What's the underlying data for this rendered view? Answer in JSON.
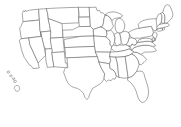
{
  "map": {
    "title": "Blank outline map of the United States",
    "projection": "Albers-like conic (contiguous US) with Hawaii inset",
    "background_color": "#ffffff",
    "border_color": "#5f5f63",
    "fill_color": "#ffffff",
    "border_width_px": 0.55,
    "width_px": 181,
    "height_px": 127,
    "labels_shown": false,
    "includes_alaska": false,
    "includes_hawaii": true,
    "hawaii_inset_position": "lower-left",
    "region_count": 49,
    "regions": [
      {
        "name": "Washington",
        "abbr": "WA",
        "label": ""
      },
      {
        "name": "Oregon",
        "abbr": "OR",
        "label": ""
      },
      {
        "name": "California",
        "abbr": "CA",
        "label": ""
      },
      {
        "name": "Nevada",
        "abbr": "NV",
        "label": ""
      },
      {
        "name": "Idaho",
        "abbr": "ID",
        "label": ""
      },
      {
        "name": "Montana",
        "abbr": "MT",
        "label": ""
      },
      {
        "name": "Wyoming",
        "abbr": "WY",
        "label": ""
      },
      {
        "name": "Utah",
        "abbr": "UT",
        "label": ""
      },
      {
        "name": "Arizona",
        "abbr": "AZ",
        "label": ""
      },
      {
        "name": "Colorado",
        "abbr": "CO",
        "label": ""
      },
      {
        "name": "New Mexico",
        "abbr": "NM",
        "label": ""
      },
      {
        "name": "North Dakota",
        "abbr": "ND",
        "label": ""
      },
      {
        "name": "South Dakota",
        "abbr": "SD",
        "label": ""
      },
      {
        "name": "Nebraska",
        "abbr": "NE",
        "label": ""
      },
      {
        "name": "Kansas",
        "abbr": "KS",
        "label": ""
      },
      {
        "name": "Oklahoma",
        "abbr": "OK",
        "label": ""
      },
      {
        "name": "Texas",
        "abbr": "TX",
        "label": ""
      },
      {
        "name": "Minnesota",
        "abbr": "MN",
        "label": ""
      },
      {
        "name": "Iowa",
        "abbr": "IA",
        "label": ""
      },
      {
        "name": "Missouri",
        "abbr": "MO",
        "label": ""
      },
      {
        "name": "Arkansas",
        "abbr": "AR",
        "label": ""
      },
      {
        "name": "Louisiana",
        "abbr": "LA",
        "label": ""
      },
      {
        "name": "Wisconsin",
        "abbr": "WI",
        "label": ""
      },
      {
        "name": "Illinois",
        "abbr": "IL",
        "label": ""
      },
      {
        "name": "Michigan",
        "abbr": "MI",
        "label": ""
      },
      {
        "name": "Indiana",
        "abbr": "IN",
        "label": ""
      },
      {
        "name": "Ohio",
        "abbr": "OH",
        "label": ""
      },
      {
        "name": "Kentucky",
        "abbr": "KY",
        "label": ""
      },
      {
        "name": "Tennessee",
        "abbr": "TN",
        "label": ""
      },
      {
        "name": "Mississippi",
        "abbr": "MS",
        "label": ""
      },
      {
        "name": "Alabama",
        "abbr": "AL",
        "label": ""
      },
      {
        "name": "Georgia",
        "abbr": "GA",
        "label": ""
      },
      {
        "name": "Florida",
        "abbr": "FL",
        "label": ""
      },
      {
        "name": "South Carolina",
        "abbr": "SC",
        "label": ""
      },
      {
        "name": "North Carolina",
        "abbr": "NC",
        "label": ""
      },
      {
        "name": "Virginia",
        "abbr": "VA",
        "label": ""
      },
      {
        "name": "West Virginia",
        "abbr": "WV",
        "label": ""
      },
      {
        "name": "Maryland",
        "abbr": "MD",
        "label": ""
      },
      {
        "name": "Delaware",
        "abbr": "DE",
        "label": ""
      },
      {
        "name": "Pennsylvania",
        "abbr": "PA",
        "label": ""
      },
      {
        "name": "New Jersey",
        "abbr": "NJ",
        "label": ""
      },
      {
        "name": "New York",
        "abbr": "NY",
        "label": ""
      },
      {
        "name": "Connecticut",
        "abbr": "CT",
        "label": ""
      },
      {
        "name": "Rhode Island",
        "abbr": "RI",
        "label": ""
      },
      {
        "name": "Massachusetts",
        "abbr": "MA",
        "label": ""
      },
      {
        "name": "Vermont",
        "abbr": "VT",
        "label": ""
      },
      {
        "name": "New Hampshire",
        "abbr": "NH",
        "label": ""
      },
      {
        "name": "Maine",
        "abbr": "ME",
        "label": ""
      },
      {
        "name": "Hawaii",
        "abbr": "HI",
        "label": ""
      }
    ]
  }
}
